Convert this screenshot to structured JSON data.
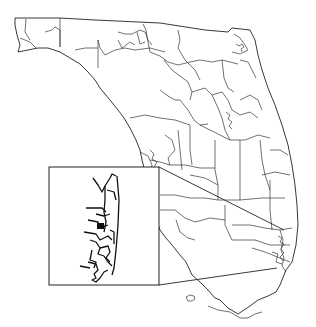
{
  "map": {
    "title": "",
    "subject": "Florida district boundaries",
    "inset": {
      "subject": "Southeast Florida (Broward / Miami-Dade coastal) detail",
      "box": {
        "x": 49,
        "y": 167,
        "w": 110,
        "h": 118
      }
    },
    "colors": {
      "background": "#ffffff",
      "boundary": "#333333",
      "inset_boundary": "#111111"
    }
  }
}
